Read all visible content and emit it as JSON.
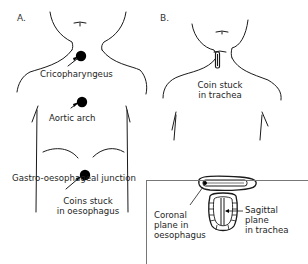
{
  "panels": {
    "a": {
      "letter": "A.",
      "labels": {
        "cricopharyngeus": "Cricopharyngeus",
        "aortic_arch": "Aortic arch",
        "ge_junction": "Gastro-oesophageal junction"
      },
      "caption_line1": "Coins stuck",
      "caption_line2": "in oesophagus"
    },
    "b": {
      "letter": "B.",
      "caption_line1": "Coin stuck",
      "caption_line2": "in trachea"
    },
    "inset": {
      "coronal_line1": "Coronal",
      "coronal_line2": "plane in",
      "coronal_line3": "oesophagus",
      "sagittal_line1": "Sagittal",
      "sagittal_line2": "plane",
      "sagittal_line3": "in trachea"
    }
  },
  "colors": {
    "line": "#1a1a1a",
    "coin": "#000000",
    "box_border": "#777777"
  }
}
